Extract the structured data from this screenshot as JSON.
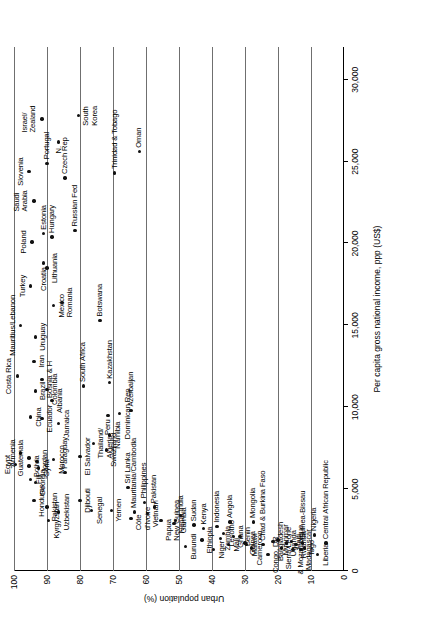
{
  "chart_data": {
    "type": "scatter",
    "title": "",
    "xlabel": "Per capita gross national income, ppp (US$)",
    "ylabel": "Urban population (%)",
    "xlim": [
      0,
      32000
    ],
    "ylim": [
      0,
      100
    ],
    "xticks": [
      "0",
      "5,000",
      "10,000",
      "15,000",
      "20,000",
      "25,000",
      "30,000"
    ],
    "xtick_values": [
      0,
      5000,
      10000,
      15000,
      20000,
      25000,
      30000
    ],
    "yticks": [
      "0",
      "10",
      "20",
      "30",
      "40",
      "50",
      "60",
      "70",
      "80",
      "90",
      "100"
    ],
    "ytick_values": [
      0,
      10,
      20,
      30,
      40,
      50,
      60,
      70,
      80,
      90,
      100
    ],
    "grid": "horizontal-gridlines-at-every-10-percent",
    "legend": "none",
    "rotation_degrees": -90,
    "points": [
      {
        "label": "Israel/\nZealand",
        "x": 27600,
        "y": 91.5,
        "lp": "t"
      },
      {
        "label": "N.",
        "x": 26200,
        "y": 86.5,
        "lp": "l"
      },
      {
        "label": "South\nKorea",
        "x": 27800,
        "y": 80.5,
        "lp": "b"
      },
      {
        "label": "Slovenia",
        "x": 24400,
        "y": 95.5,
        "lp": "t"
      },
      {
        "label": "Portugal",
        "x": 24900,
        "y": 90.0,
        "lp": "r"
      },
      {
        "label": "Czech Rep",
        "x": 24000,
        "y": 84.5,
        "lp": "r"
      },
      {
        "label": "Trinidad & Tobago",
        "x": 24300,
        "y": 69.5,
        "lp": "r"
      },
      {
        "label": "Oman",
        "x": 25600,
        "y": 62.0,
        "lp": "r"
      },
      {
        "label": "Saudi\nArabia",
        "x": 22600,
        "y": 94.0,
        "lp": "t"
      },
      {
        "label": "Poland",
        "x": 20100,
        "y": 94.5,
        "lp": "t"
      },
      {
        "label": "Estonia",
        "x": 20600,
        "y": 91.0,
        "lp": "r"
      },
      {
        "label": "Hungary",
        "x": 20400,
        "y": 88.5,
        "lp": "r"
      },
      {
        "label": "Russian Fed",
        "x": 20800,
        "y": 81.5,
        "lp": "r"
      },
      {
        "label": "Croatia",
        "x": 18800,
        "y": 91.0,
        "lp": "l"
      },
      {
        "label": "Turkey",
        "x": 17400,
        "y": 95.0,
        "lp": "t"
      },
      {
        "label": "Lithuania",
        "x": 18500,
        "y": 90.0,
        "lp": "b"
      },
      {
        "label": "Mexico",
        "x": 16200,
        "y": 88.0,
        "lp": "b"
      },
      {
        "label": "Romania",
        "x": 16400,
        "y": 85.5,
        "lp": "b"
      },
      {
        "label": "Mauritius/Lebanon",
        "x": 15000,
        "y": 98.0,
        "lp": "t"
      },
      {
        "label": "Uruguay",
        "x": 14300,
        "y": 93.5,
        "lp": "b"
      },
      {
        "label": "Botswana",
        "x": 15300,
        "y": 74.0,
        "lp": "r"
      },
      {
        "label": "Iran",
        "x": 12800,
        "y": 94.0,
        "lp": "b"
      },
      {
        "label": "Costa Rica",
        "x": 11900,
        "y": 99.0,
        "lp": "t"
      },
      {
        "label": "Bosnia & H",
        "x": 11700,
        "y": 91.5,
        "lp": "b"
      },
      {
        "label": "Brazil",
        "x": 11000,
        "y": 93.5,
        "lp": "b"
      },
      {
        "label": "Colombia",
        "x": 11100,
        "y": 90.0,
        "lp": "b"
      },
      {
        "label": "South Africa",
        "x": 11300,
        "y": 79.0,
        "lp": "r"
      },
      {
        "label": "Albania",
        "x": 10400,
        "y": 88.5,
        "lp": "b"
      },
      {
        "label": "Kazakhstan",
        "x": 11500,
        "y": 71.0,
        "lp": "r"
      },
      {
        "label": "China",
        "x": 9400,
        "y": 95.0,
        "lp": "b"
      },
      {
        "label": "Ecuador",
        "x": 9300,
        "y": 91.5,
        "lp": "b"
      },
      {
        "label": "Jamaica",
        "x": 9000,
        "y": 86.5,
        "lp": "b"
      },
      {
        "label": "Peru",
        "x": 9500,
        "y": 71.5,
        "lp": "l"
      },
      {
        "label": "Dominican Rep",
        "x": 9600,
        "y": 68.0,
        "lp": "b"
      },
      {
        "label": "Azerbaijan",
        "x": 9800,
        "y": 64.5,
        "lp": "r"
      },
      {
        "label": "Armenia",
        "x": 7200,
        "y": 98.0,
        "lp": "t"
      },
      {
        "label": "Guatemala",
        "x": 6900,
        "y": 95.5,
        "lp": "t"
      },
      {
        "label": "Jordan",
        "x": 6700,
        "y": 93.0,
        "lp": "b"
      },
      {
        "label": "Bolivia",
        "x": 6400,
        "y": 95.5,
        "lp": "b"
      },
      {
        "label": "Syria",
        "x": 6300,
        "y": 92.5,
        "lp": "b"
      },
      {
        "label": "Morocco",
        "x": 6800,
        "y": 88.0,
        "lp": "b"
      },
      {
        "label": "Thailand/\nAlgeria",
        "x": 7800,
        "y": 76.0,
        "lp": "b"
      },
      {
        "label": "Swaziland",
        "x": 7400,
        "y": 72.0,
        "lp": "b"
      },
      {
        "label": "Namibia",
        "x": 8300,
        "y": 71.0,
        "lp": "b"
      },
      {
        "label": "Egypt",
        "x": 6500,
        "y": 99.5,
        "lp": "t"
      },
      {
        "label": "Fiji",
        "x": 5600,
        "y": 95.0,
        "lp": "b"
      },
      {
        "label": "Georgia",
        "x": 5400,
        "y": 93.5,
        "lp": "b"
      },
      {
        "label": "Honduras",
        "x": 4300,
        "y": 94.0,
        "lp": "b"
      },
      {
        "label": "Paraguay",
        "x": 6000,
        "y": 84.5,
        "lp": "r"
      },
      {
        "label": "El Salvador",
        "x": 7000,
        "y": 80.0,
        "lp": "b"
      },
      {
        "label": "Pakistan",
        "x": 3900,
        "y": 90.0,
        "lp": "b"
      },
      {
        "label": "Kyrgyzstan",
        "x": 3100,
        "y": 89.5,
        "lp": "b"
      },
      {
        "label": "Uzbekistan",
        "x": 3600,
        "y": 86.5,
        "lp": "b"
      },
      {
        "label": "Djibouti",
        "x": 4300,
        "y": 80.0,
        "lp": "b"
      },
      {
        "label": "Senegal",
        "x": 3700,
        "y": 76.5,
        "lp": "b"
      },
      {
        "label": "Yemen",
        "x": 3700,
        "y": 70.5,
        "lp": "b"
      },
      {
        "label": "Sri Lanka",
        "x": 5100,
        "y": 65.5,
        "lp": "r"
      },
      {
        "label": "Mauritania/Cambodia",
        "x": 3600,
        "y": 63.5,
        "lp": "r"
      },
      {
        "label": "Côte\nd'Ivoire",
        "x": 3200,
        "y": 64.5,
        "lp": "b"
      },
      {
        "label": "Philippines",
        "x": 4200,
        "y": 60.5,
        "lp": "r"
      },
      {
        "label": "Vietnam",
        "x": 3500,
        "y": 59.5,
        "lp": "b"
      },
      {
        "label": "Pakistan",
        "x": 3900,
        "y": 57.5,
        "lp": "r"
      },
      {
        "label": "Papua\nNew Guinea",
        "x": 3100,
        "y": 55.5,
        "lp": "b"
      },
      {
        "label": "Nepal",
        "x": 2900,
        "y": 51.5,
        "lp": "b"
      },
      {
        "label": "Gambia",
        "x": 3100,
        "y": 51.0,
        "lp": "b"
      },
      {
        "label": "India",
        "x": 3400,
        "y": 49.5,
        "lp": "r"
      },
      {
        "label": "Sudan",
        "x": 2800,
        "y": 45.5,
        "lp": "r"
      },
      {
        "label": "Burundi",
        "x": 1500,
        "y": 48.0,
        "lp": "b"
      },
      {
        "label": "Ethiopia",
        "x": 1900,
        "y": 43.0,
        "lp": "b"
      },
      {
        "label": "Kenya",
        "x": 2600,
        "y": 42.5,
        "lp": "r"
      },
      {
        "label": "Niger",
        "x": 1300,
        "y": 39.5,
        "lp": "b"
      },
      {
        "label": "Zambia",
        "x": 2000,
        "y": 37.5,
        "lp": "b"
      },
      {
        "label": "Mali",
        "x": 1600,
        "y": 35.0,
        "lp": "b"
      },
      {
        "label": "Lesotho",
        "x": 2300,
        "y": 36.5,
        "lp": "b"
      },
      {
        "label": "Indonesia",
        "x": 2700,
        "y": 38.5,
        "lp": "r"
      },
      {
        "label": "Angola",
        "x": 3000,
        "y": 34.5,
        "lp": "r"
      },
      {
        "label": "Ghana",
        "x": 2100,
        "y": 33.5,
        "lp": "b"
      },
      {
        "label": "Benin",
        "x": 2100,
        "y": 31.5,
        "lp": "b"
      },
      {
        "label": "Guinea",
        "x": 1700,
        "y": 30.0,
        "lp": "b"
      },
      {
        "label": "Malawi",
        "x": 1600,
        "y": 29.5,
        "lp": "b"
      },
      {
        "label": "Cameroon",
        "x": 1400,
        "y": 28.0,
        "lp": "b"
      },
      {
        "label": "Mongolia",
        "x": 3000,
        "y": 27.5,
        "lp": "r"
      },
      {
        "label": "Chad & Burkina Faso",
        "x": 1600,
        "y": 24.5,
        "lp": "r"
      },
      {
        "label": "Congo, DR",
        "x": 1000,
        "y": 23.0,
        "lp": "b"
      },
      {
        "label": "Bangladesh",
        "x": 1800,
        "y": 21.5,
        "lp": "b"
      },
      {
        "label": "Myanmar",
        "x": 1900,
        "y": 20.0,
        "lp": "b"
      },
      {
        "label": "Sierra Leone",
        "x": 1400,
        "y": 19.0,
        "lp": "b"
      },
      {
        "label": "Uganda",
        "x": 1700,
        "y": 17.5,
        "lp": "b"
      },
      {
        "label": "Haiti",
        "x": 1800,
        "y": 16.0,
        "lp": "b"
      },
      {
        "label": "& Mozambique",
        "x": 1300,
        "y": 15.5,
        "lp": "b"
      },
      {
        "label": "Rwanda",
        "x": 1600,
        "y": 14.5,
        "lp": "b"
      },
      {
        "label": "Madagascar",
        "x": 1300,
        "y": 13.0,
        "lp": "b"
      },
      {
        "label": "Togo",
        "x": 1400,
        "y": 12.0,
        "lp": "b"
      },
      {
        "label": "Guinea-Bissau",
        "x": 1700,
        "y": 12.5,
        "lp": "r"
      },
      {
        "label": "Nigeria",
        "x": 2200,
        "y": 9.0,
        "lp": "r"
      },
      {
        "label": "Liberia",
        "x": 1000,
        "y": 8.0,
        "lp": "b"
      },
      {
        "label": "Central African Republic",
        "x": 1700,
        "y": 5.5,
        "lp": "r"
      }
    ]
  }
}
